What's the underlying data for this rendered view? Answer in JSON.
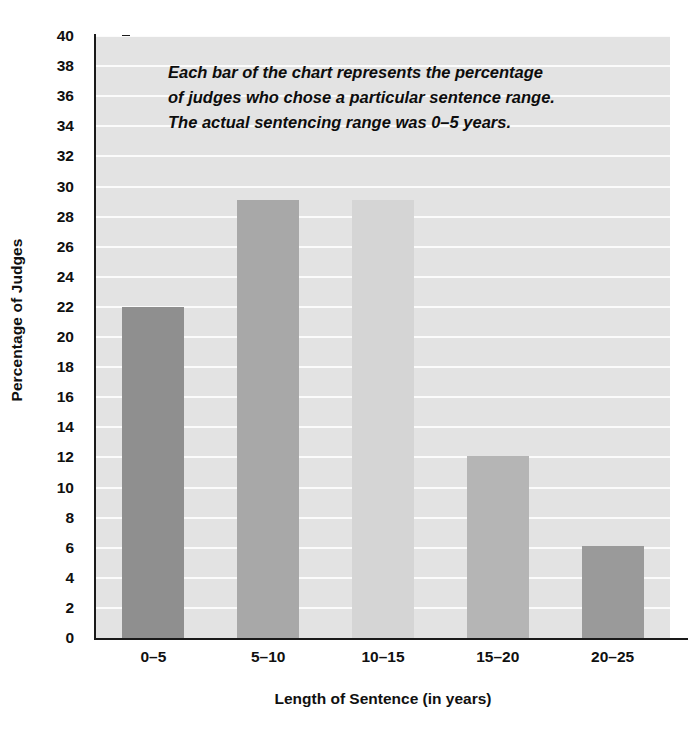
{
  "chart_data": {
    "type": "bar",
    "title": "",
    "categories": [
      "0–5",
      "5–10",
      "10–15",
      "15–20",
      "20–25"
    ],
    "values": [
      22,
      29.1,
      29.1,
      12.1,
      6.1
    ],
    "series": [
      {
        "name": "Percentage of Judges",
        "values": [
          22,
          29.1,
          29.1,
          12.1,
          6.1
        ]
      }
    ],
    "xlabel": "Length of Sentence (in years)",
    "ylabel": "Percentage of Judges",
    "ylim": [
      0,
      40
    ],
    "ytick_step": 2,
    "yticks": [
      0,
      2,
      4,
      6,
      8,
      10,
      12,
      14,
      16,
      18,
      20,
      22,
      24,
      26,
      28,
      30,
      32,
      34,
      36,
      38,
      40
    ],
    "ytick_labels": [
      "0",
      "2",
      "4",
      "6",
      "8",
      "10",
      "12",
      "14",
      "16",
      "18",
      "20",
      "22",
      "24",
      "26",
      "28",
      "30",
      "32",
      "34",
      "36",
      "38",
      "40"
    ],
    "grid": true,
    "grid_orientation": "horizontal",
    "grid_color": "#fbfbfb",
    "legend": false,
    "legend_position": "none",
    "plot_background": "#e3e3e3",
    "bar_colors": [
      "#8f8f8f",
      "#a8a8a8",
      "#d5d5d5",
      "#b5b5b5",
      "#9a9a9a"
    ],
    "annotation": {
      "lines": [
        "Each bar of the chart represents the percentage",
        "of judges who chose a particular sentence range.",
        "The actual sentencing range was 0–5 years."
      ]
    }
  }
}
